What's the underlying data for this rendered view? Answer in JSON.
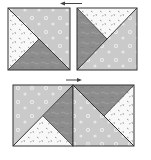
{
  "diagram": {
    "colors": {
      "light_fabric": "#c9c9c9",
      "dark_fabric": "#8a8a8a",
      "white_fabric": "#f7f7f7",
      "outline": "#333333",
      "arrow": "#444444"
    },
    "top_row": {
      "arrow_direction": "left",
      "blocks": [
        {
          "name": "block-1",
          "triangles": [
            "light-top-right",
            "white-left",
            "dark-bottom"
          ]
        },
        {
          "name": "block-2",
          "triangles": [
            "white-top",
            "dark-left",
            "light-bottom-right"
          ]
        }
      ]
    },
    "bottom_row": {
      "arrow_direction": "right",
      "blocks": [
        {
          "name": "block-3",
          "triangles": [
            "light-top-left",
            "dark-right",
            "white-bottom"
          ]
        },
        {
          "name": "block-4",
          "triangles": [
            "light-bottom-left",
            "dark-top",
            "white-right"
          ]
        }
      ]
    }
  }
}
